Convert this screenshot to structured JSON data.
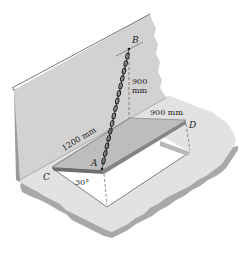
{
  "diagram": {
    "points": {
      "A": "A",
      "B": "B",
      "C": "C",
      "D": "D"
    },
    "dimensions": {
      "vertical_height": "900",
      "vertical_height_unit": "mm",
      "plate_width": "900 mm",
      "plate_length": "1200 mm",
      "angle": "30°"
    },
    "colors": {
      "wall": "#d2d2d2",
      "wall_edge": "#9a9a9a",
      "floor": "#e2e2e2",
      "floor_edge": "#a8a8a8",
      "plate_top": "#bdbdbd",
      "plate_edge": "#6e6e6e",
      "opening": "#ffffff",
      "chain": "#1e1e1e"
    }
  }
}
